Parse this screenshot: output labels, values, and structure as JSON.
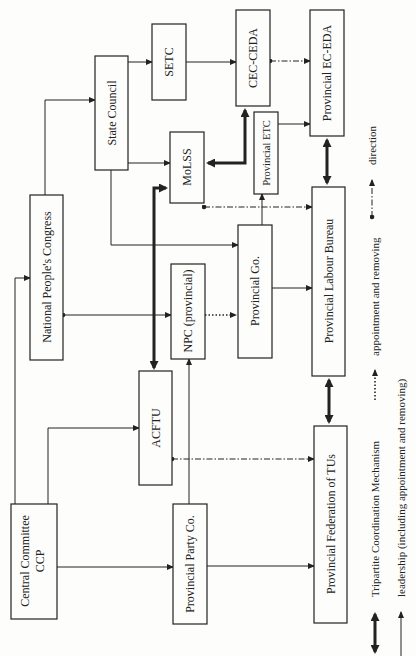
{
  "diagram": {
    "orientation": "rotated 90deg counter-clockwise (text reads bottom-to-top)",
    "nodes": {
      "central_committee": {
        "line1": "Central Committee",
        "line2": "CCP"
      },
      "national_peoples_congress": {
        "label": "National People's Congress"
      },
      "state_council": {
        "label": "State Council"
      },
      "setc": {
        "label": "SETC"
      },
      "cec_ceda": {
        "label": "CEC-CEDA"
      },
      "molss": {
        "label": "MoLSS"
      },
      "provincial_etc": {
        "label": "Provincial ETC"
      },
      "provincial_ec_eda": {
        "label": "Provincial EC-EDA"
      },
      "acftu": {
        "label": "ACFTU"
      },
      "npc_provincial": {
        "label": "NPC (provincial)"
      },
      "provincial_go": {
        "label": "Provincial Go."
      },
      "provincial_labour_bureau": {
        "label": "Provincial Labour Bureau"
      },
      "provincial_party_co": {
        "label": "Provincial Party Co."
      },
      "provincial_federation_tus": {
        "label": "Provincial Federation of TUs"
      }
    },
    "edges": [
      {
        "from": "Central Committee CCP",
        "to": "National People's Congress",
        "type": "leadership"
      },
      {
        "from": "Central Committee CCP",
        "to": "ACFTU",
        "type": "leadership"
      },
      {
        "from": "Central Committee CCP",
        "to": "Provincial Party Co.",
        "type": "leadership"
      },
      {
        "from": "National People's Congress",
        "to": "State Council",
        "type": "leadership"
      },
      {
        "from": "National People's Congress",
        "to": "NPC (provincial)",
        "type": "leadership"
      },
      {
        "from": "State Council",
        "to": "SETC",
        "type": "leadership"
      },
      {
        "from": "State Council",
        "to": "MoLSS",
        "type": "leadership"
      },
      {
        "from": "State Council",
        "to": "Provincial Go.",
        "type": "leadership"
      },
      {
        "from": "SETC",
        "to": "CEC-CEDA",
        "type": "leadership"
      },
      {
        "from": "CEC-CEDA",
        "to": "Provincial EC-EDA",
        "type": "direction"
      },
      {
        "from": "Provincial ETC",
        "to": "Provincial EC-EDA",
        "type": "leadership"
      },
      {
        "from": "Provincial Go.",
        "to": "Provincial ETC",
        "type": "leadership"
      },
      {
        "from": "Provincial Go.",
        "to": "Provincial Labour Bureau",
        "type": "leadership"
      },
      {
        "from": "MoLSS",
        "to": "Provincial Labour Bureau",
        "type": "direction"
      },
      {
        "from": "NPC (provincial)",
        "to": "Provincial Go.",
        "type": "appointment and removing"
      },
      {
        "from": "Provincial Party Co.",
        "to": "NPC (provincial)",
        "type": "leadership"
      },
      {
        "from": "Provincial Party Co.",
        "to": "Provincial Federation of TUs",
        "type": "leadership"
      },
      {
        "from": "ACFTU",
        "to": "Provincial Federation of TUs",
        "type": "direction"
      },
      {
        "from": "ACFTU",
        "to": "MoLSS",
        "type": "tripartite"
      },
      {
        "from": "MoLSS",
        "to": "CEC-CEDA",
        "type": "tripartite"
      },
      {
        "from": "Provincial EC-EDA",
        "to": "Provincial Labour Bureau",
        "type": "tripartite"
      },
      {
        "from": "Provincial Labour Bureau",
        "to": "Provincial Federation of TUs",
        "type": "tripartite"
      }
    ]
  },
  "legend": {
    "tripartite": "Tripartite Coordination Mechanism",
    "leadership": "leadership (including appointment and removing)",
    "appointment": "appointment and removing",
    "direction": "direction"
  },
  "colors": {
    "ink": "#222222",
    "paper": "#fdfdfb"
  }
}
